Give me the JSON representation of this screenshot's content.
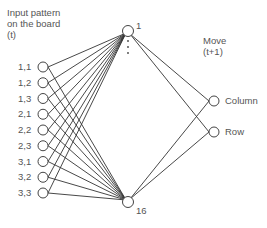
{
  "diagram": {
    "type": "neural-network",
    "input_layer": {
      "title_lines": [
        "Input pattern",
        "on the board",
        "(t)"
      ],
      "nodes": [
        "1,1",
        "1,2",
        "1,3",
        "2,1",
        "2,2",
        "2,3",
        "3,1",
        "3,2",
        "3,3"
      ]
    },
    "hidden_layer": {
      "top_label": "1",
      "bottom_label": "16",
      "ellipsis": "⋮"
    },
    "output_layer": {
      "title_lines": [
        "Move",
        "(t+1)"
      ],
      "nodes": [
        "Column",
        "Row"
      ]
    },
    "colors": {
      "line": "#333333",
      "node_stroke": "#444444",
      "text": "#555555"
    }
  }
}
